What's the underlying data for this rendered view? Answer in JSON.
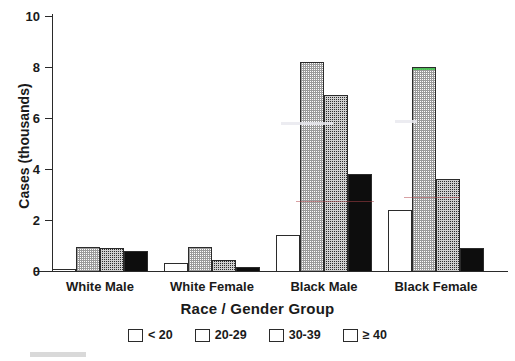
{
  "chart_data": {
    "type": "bar",
    "title": "",
    "xlabel": "Race / Gender Group",
    "ylabel": "Cases (thousands)",
    "categories": [
      "White Male",
      "White Female",
      "Black Male",
      "Black Female"
    ],
    "series": [
      {
        "name": "< 20",
        "values": [
          0.08,
          0.3,
          1.4,
          2.4
        ]
      },
      {
        "name": "20-29",
        "values": [
          0.95,
          0.95,
          8.2,
          8.0
        ]
      },
      {
        "name": "30-39",
        "values": [
          0.9,
          0.45,
          6.9,
          3.6
        ]
      },
      {
        "name": "≥ 40",
        "values": [
          0.8,
          0.15,
          3.8,
          0.9
        ]
      }
    ],
    "ylim": [
      0,
      10
    ],
    "yticks": [
      0,
      2,
      4,
      6,
      8,
      10
    ],
    "ytick_labels": [
      "0",
      "2",
      "4",
      "6",
      "8",
      "10"
    ],
    "grid": false,
    "legend_position": "bottom"
  },
  "legend": {
    "items": [
      {
        "label": "< 20",
        "swatch": "white-swatch",
        "color": "#ffffff"
      },
      {
        "label": "20-29",
        "swatch": "light-gray-swatch",
        "color": "#c9c9c9"
      },
      {
        "label": "30-39",
        "swatch": "dark-gray-swatch",
        "color": "#4a4a4a"
      },
      {
        "label": "≥ 40",
        "swatch": "black-swatch",
        "color": "#0d0d0d"
      }
    ]
  }
}
